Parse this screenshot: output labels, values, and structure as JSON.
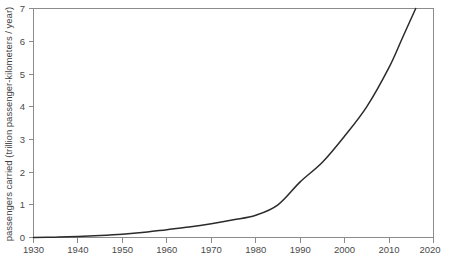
{
  "chart_data": {
    "type": "line",
    "title": "",
    "subtitle": "",
    "xlabel": "",
    "ylabel": "passengers carried (trillion passenger-kilometers / year)",
    "xlim": [
      1930,
      2020
    ],
    "ylim": [
      0,
      7
    ],
    "grid": false,
    "legend": "none",
    "x_ticks": [
      1930,
      1940,
      1950,
      1960,
      1970,
      1980,
      1990,
      2000,
      2010,
      2020
    ],
    "x_tick_labels": [
      "1930",
      "1940",
      "1950",
      "1960",
      "1970",
      "1980",
      "1990",
      "2000",
      "2010",
      "2020"
    ],
    "y_ticks": [
      0,
      1,
      2,
      3,
      4,
      5,
      6,
      7
    ],
    "y_tick_labels": [
      "0",
      "1",
      "2",
      "3",
      "4",
      "5",
      "6",
      "7"
    ],
    "series": [
      {
        "name": "passengers carried",
        "color": "#2b2b2b",
        "x": [
          1930,
          1935,
          1940,
          1945,
          1950,
          1955,
          1960,
          1965,
          1970,
          1975,
          1980,
          1985,
          1990,
          1995,
          2000,
          2005,
          2010,
          2013,
          2016
        ],
        "values": [
          0.0,
          0.01,
          0.03,
          0.06,
          0.1,
          0.16,
          0.24,
          0.32,
          0.42,
          0.54,
          0.68,
          1.0,
          1.7,
          2.3,
          3.1,
          4.0,
          5.2,
          6.1,
          7.0
        ]
      }
    ],
    "annotations": []
  },
  "axes": {
    "y_axis_title": "passengers carried (trillion passenger-kilometers / year)",
    "x_axis_title": ""
  },
  "colors": {
    "curve": "#2b2b2b",
    "axis": "#8c8c8c",
    "text": "#4a4a4a",
    "background": "#ffffff"
  }
}
